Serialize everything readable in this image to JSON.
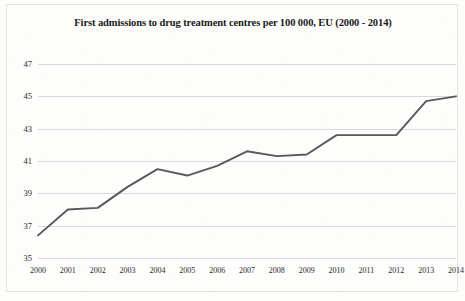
{
  "chart_data": {
    "type": "line",
    "title": "First admissions to drug treatment centres per 100 000, EU (2000 - 2014)",
    "xlabel": "",
    "ylabel": "",
    "categories": [
      "2000",
      "2001",
      "2002",
      "2003",
      "2004",
      "2005",
      "2006",
      "2007",
      "2008",
      "2009",
      "2010",
      "2011",
      "2012",
      "2013",
      "2014"
    ],
    "values": [
      36.4,
      38.0,
      38.1,
      39.4,
      40.5,
      40.1,
      40.7,
      41.6,
      41.3,
      41.4,
      42.6,
      42.6,
      42.6,
      44.7,
      45.0
    ],
    "series": [
      {
        "name": "First admissions per 100 000",
        "values": [
          36.4,
          38.0,
          38.1,
          39.4,
          40.5,
          40.1,
          40.7,
          41.6,
          41.3,
          41.4,
          42.6,
          42.6,
          42.6,
          44.7,
          45.0
        ]
      }
    ],
    "ylim": [
      35,
      47
    ],
    "ytick_labels": [
      "35",
      "37",
      "39",
      "41",
      "43",
      "45",
      "47"
    ],
    "ytick_values": [
      35,
      37,
      39,
      41,
      43,
      45,
      47
    ],
    "xtick_labels": [
      "2000",
      "2001",
      "2002",
      "2003",
      "2004",
      "2005",
      "2006",
      "2007",
      "2008",
      "2009",
      "2010",
      "2011",
      "2012",
      "2013",
      "2014"
    ],
    "grid": "horizontal",
    "legend": "none",
    "line_color": "#595959",
    "grid_color": "#d9d9d9",
    "background_color": "#ffffff"
  }
}
